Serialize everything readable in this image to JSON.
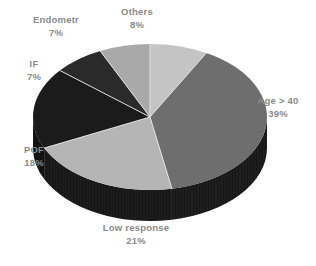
{
  "chart_data": {
    "type": "pie",
    "title": "",
    "subtitle": "",
    "xlabel": "",
    "ylabel": "",
    "legend_position": "none",
    "grid": false,
    "three_d": true,
    "unit": "%",
    "categories": [
      "Others",
      "Age > 40",
      "Low response",
      "POF",
      "IF",
      "Endometr"
    ],
    "values": [
      8,
      39,
      21,
      18,
      7,
      7
    ],
    "total": 100,
    "slices": [
      {
        "label": "Others",
        "value": 8,
        "percent_text": "8%",
        "color": "#c4c4c4",
        "side_color": "#202020",
        "start_angle": 0,
        "end_angle": 28.8
      },
      {
        "label": "Age > 40",
        "value": 39,
        "percent_text": "39%",
        "color": "#6e6e6e",
        "side_color": "#1e1e1e",
        "start_angle": 28.8,
        "end_angle": 169.2
      },
      {
        "label": "Low response",
        "value": 21,
        "percent_text": "21%",
        "color": "#b5b5b5",
        "side_color": "#1c1c1c",
        "start_angle": 169.2,
        "end_angle": 244.8
      },
      {
        "label": "POF",
        "value": 18,
        "percent_text": "18%",
        "color": "#1b1b1b",
        "side_color": "#141414",
        "start_angle": 244.8,
        "end_angle": 309.6
      },
      {
        "label": "IF",
        "value": 7,
        "percent_text": "7%",
        "color": "#2a2a2a",
        "side_color": "#161616",
        "start_angle": 309.6,
        "end_angle": 334.8
      },
      {
        "label": "Endometr",
        "value": 7,
        "percent_text": "7%",
        "color": "#a9a9a9",
        "side_color": "#1a1a1a",
        "start_angle": 334.8,
        "end_angle": 360
      }
    ]
  },
  "labels": {
    "endometr": {
      "name": "Endometr",
      "pct": "7%"
    },
    "others": {
      "name": "Others",
      "pct": "8%"
    },
    "age": {
      "name": "Age > 40",
      "pct": "39%"
    },
    "if": {
      "name": "IF",
      "pct": "7%"
    },
    "pof": {
      "name": "POF",
      "pct": "18%"
    },
    "low": {
      "name": "Low response",
      "pct": "21%"
    }
  },
  "style": {
    "background": "#ffffff",
    "label_color": "#8a8a8a",
    "divider_color": "#e8e8e8"
  }
}
